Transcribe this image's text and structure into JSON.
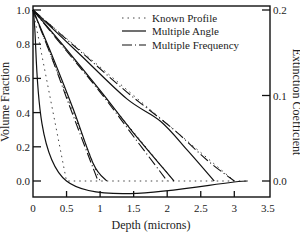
{
  "chart_data": {
    "type": "line",
    "title": "",
    "xlabel": "Depth (microns)",
    "ylabel": "Volume Fraction",
    "y2label": "Extinction Coefficient",
    "xlim": [
      0,
      3.5
    ],
    "ylim": [
      0,
      1.0
    ],
    "y2lim": [
      0,
      0.2
    ],
    "xticks": [
      "0",
      "0.5",
      "1",
      "1.5",
      "2",
      "2.5",
      "3",
      "3.5"
    ],
    "yticks": [
      "0.0",
      "0.2",
      "0.4",
      "0.6",
      "0.8",
      "1.0"
    ],
    "y2ticks": [
      "0.0",
      "0.1",
      "0.2"
    ],
    "grid": false,
    "legend_position": "upper right",
    "legend": [
      "Known Profile",
      "Multiple Angle",
      "Multiple Frequency"
    ],
    "series": [
      {
        "name": "Known Profile",
        "style": "dotted",
        "profiles": [
          {
            "x": [
              0,
              0.5,
              3.2
            ],
            "y": [
              1.0,
              0.0,
              0.0
            ]
          },
          {
            "x": [
              0,
              1.0
            ],
            "y": [
              1.0,
              0.0
            ]
          },
          {
            "x": [
              0,
              2.1
            ],
            "y": [
              1.0,
              0.0
            ]
          },
          {
            "x": [
              0,
              3.0
            ],
            "y": [
              1.0,
              0.0
            ]
          }
        ]
      },
      {
        "name": "Multiple Angle",
        "style": "solid",
        "profiles": [
          {
            "x": [
              0,
              0.5,
              3.2
            ],
            "y": [
              1.0,
              0.0,
              0.0
            ]
          },
          {
            "x": [
              0,
              0.3,
              0.6,
              0.9,
              1.1
            ],
            "y": [
              1.0,
              0.72,
              0.42,
              0.1,
              0.0
            ]
          },
          {
            "x": [
              0,
              0.5,
              1.0,
              1.5,
              2.1
            ],
            "y": [
              1.0,
              0.77,
              0.53,
              0.28,
              0.0
            ]
          },
          {
            "x": [
              0,
              0.7,
              1.4,
              1.9,
              2.3,
              2.7
            ],
            "y": [
              1.0,
              0.74,
              0.48,
              0.35,
              0.18,
              0.0
            ]
          }
        ]
      },
      {
        "name": "Multiple Frequency",
        "style": "dashdot",
        "profiles": [
          {
            "x": [
              0,
              0.3,
              0.6,
              0.97
            ],
            "y": [
              1.0,
              0.7,
              0.38,
              0.0
            ]
          },
          {
            "x": [
              0,
              0.5,
              1.0,
              1.5,
              2.0
            ],
            "y": [
              1.0,
              0.76,
              0.52,
              0.26,
              0.0
            ]
          },
          {
            "x": [
              0,
              0.7,
              1.4,
              2.1,
              2.6,
              3.0
            ],
            "y": [
              1.0,
              0.76,
              0.52,
              0.3,
              0.12,
              0.0
            ]
          }
        ]
      }
    ]
  },
  "axes": {
    "xlabel": "Depth (microns)",
    "ylabel": "Volume Fraction",
    "y2label": "Extinction Coefficient"
  },
  "legend": {
    "known": "Known Profile",
    "angle": "Multiple Angle",
    "freq": "Multiple Frequency"
  }
}
